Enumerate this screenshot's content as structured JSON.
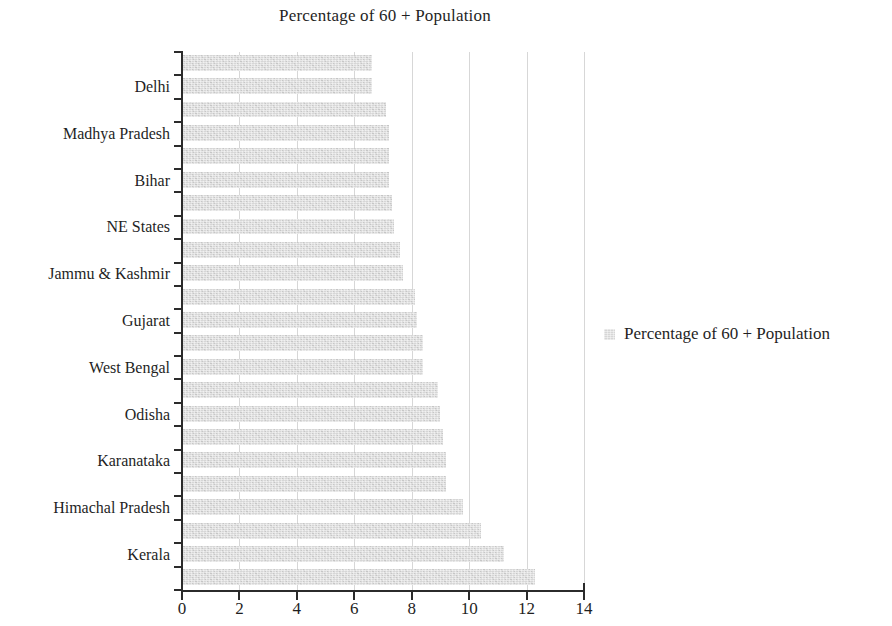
{
  "chart_data": {
    "type": "bar",
    "orientation": "horizontal",
    "title": "Percentage of 60 + Population",
    "xlabel": "",
    "ylabel": "",
    "xlim": [
      0,
      14
    ],
    "xticks": [
      "0",
      "2",
      "4",
      "6",
      "8",
      "10",
      "12",
      "14"
    ],
    "grid": "vertical",
    "legend_position": "right",
    "legend": [
      "Percentage of 60 + Population"
    ],
    "series_name": "Percentage of 60 + Population",
    "bar_color": "#d6d6d6",
    "categories": [
      "",
      "Delhi",
      "",
      "Madhya Pradesh",
      "",
      "Bihar",
      "",
      "NE States",
      "",
      "Jammu & Kashmir",
      "",
      "Gujarat",
      "",
      "West Bengal",
      "",
      "Odisha",
      "",
      "Karanataka",
      "",
      "Himachal Pradesh",
      "",
      "Kerala",
      ""
    ],
    "visible_tick_labels": [
      "Delhi",
      "Madhya Pradesh",
      "Bihar",
      "NE States",
      "Jammu & Kashmir",
      "Gujarat",
      "West Bengal",
      "Odisha",
      "Karanataka",
      "Himachal Pradesh",
      "Kerala"
    ],
    "values": [
      6.6,
      6.6,
      7.1,
      7.2,
      7.2,
      7.2,
      7.3,
      7.4,
      7.6,
      7.7,
      8.1,
      8.2,
      8.4,
      8.4,
      8.9,
      9.0,
      9.1,
      9.2,
      9.2,
      9.8,
      10.4,
      11.2,
      12.3
    ]
  },
  "title": {
    "text": "Percentage of 60 + Population"
  },
  "legend": {
    "swatch": "legend-color-swatch",
    "label": "Percentage of 60 + Population"
  }
}
